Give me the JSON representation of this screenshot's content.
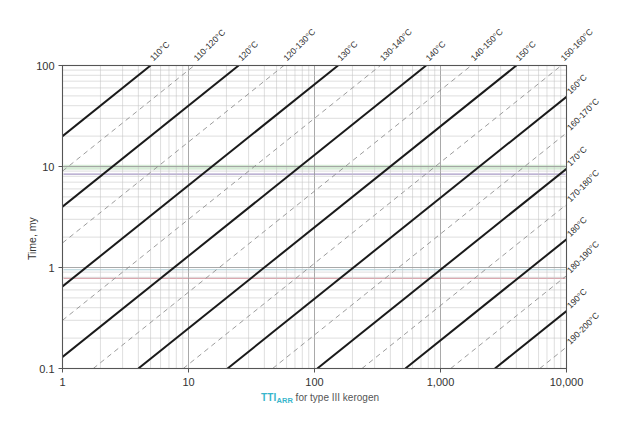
{
  "chart_data": {
    "type": "line",
    "title": "",
    "xlabel": "TTI_ARR for type III kerogen",
    "xlabel_prefix": "TTI",
    "xlabel_sub": "ARR",
    "xlabel_suffix": " for type III kerogen",
    "ylabel": "Time, my",
    "xscale": "log",
    "yscale": "log",
    "xlim": [
      1,
      10000
    ],
    "ylim": [
      0.1,
      100
    ],
    "grid": "log-minor-both",
    "legend": "none",
    "xticks": [
      "1",
      "10",
      "100",
      "1,000",
      "10,000"
    ],
    "xtick_values": [
      1,
      10,
      100,
      1000,
      10000
    ],
    "yticks": [
      "100",
      "10",
      "1",
      "0.1"
    ],
    "ytick_values": [
      100,
      10,
      1,
      0.1
    ],
    "accent_color": "#38b6cc",
    "solid_line_color": "#1a1a1a",
    "dashed_line_color": "#8a8a8a",
    "grid_color": "#b8b8b8",
    "axis_color": "#555555",
    "highlight_bands": [
      {
        "name": "green-band",
        "y_top": 10.4,
        "y_bottom": 9.3,
        "color": "#cfe8cf"
      },
      {
        "name": "violet-line",
        "y": 8.4,
        "color": "#a090c0"
      },
      {
        "name": "pink-line",
        "y": 0.78,
        "color": "#d8a0a8"
      },
      {
        "name": "teal-line",
        "y": 0.95,
        "color": "#a8ccd4"
      }
    ],
    "series": [
      {
        "name": "110 C",
        "style": "solid",
        "label": "110°C",
        "label_side": "top",
        "y_at_x1": 20.0
      },
      {
        "name": "110-120 C",
        "style": "dashed",
        "label": "110-120°C",
        "label_side": "top",
        "y_at_x1": 9.0
      },
      {
        "name": "120 C",
        "style": "solid",
        "label": "120°C",
        "label_side": "top",
        "y_at_x1": 4.0
      },
      {
        "name": "120-130 C",
        "style": "dashed",
        "label": "120-130°C",
        "label_side": "top",
        "y_at_x1": 1.75
      },
      {
        "name": "130 C",
        "style": "solid",
        "label": "130°C",
        "label_side": "top",
        "y_at_x1": 0.65
      },
      {
        "name": "130-140 C",
        "style": "dashed",
        "label": "130-140°C",
        "label_side": "top",
        "y_at_x1": 0.3
      },
      {
        "name": "140 C",
        "style": "solid",
        "label": "140°C",
        "label_side": "top",
        "y_at_x1": 0.13
      },
      {
        "name": "140-150 C",
        "style": "dashed",
        "label": "140-150°C",
        "label_side": "top",
        "y_at_x1": 0.057
      },
      {
        "name": "150 C",
        "style": "solid",
        "label": "150°C",
        "label_side": "top",
        "y_at_x1": 0.025
      },
      {
        "name": "150-160 C",
        "style": "dashed",
        "label": "150-160°C",
        "label_side": "top",
        "y_at_x1": 0.011
      },
      {
        "name": "160 C",
        "style": "solid",
        "label": "160°C",
        "label_side": "top",
        "y_at_x1": 0.0049
      },
      {
        "name": "160-170 C",
        "style": "dashed",
        "label": "160-170°C",
        "label_side": "right",
        "y_at_x1": 0.00215
      },
      {
        "name": "170 C",
        "style": "solid",
        "label": "170°C",
        "label_side": "right",
        "y_at_x1": 0.00095
      },
      {
        "name": "170-180 C",
        "style": "dashed",
        "label": "170-180°C",
        "label_side": "right",
        "y_at_x1": 0.00042
      },
      {
        "name": "180 C",
        "style": "solid",
        "label": "180°C",
        "label_side": "right",
        "y_at_x1": 0.00019
      },
      {
        "name": "180-190 C",
        "style": "dashed",
        "label": "180-190°C",
        "label_side": "right",
        "y_at_x1": 8.3e-05
      },
      {
        "name": "190 C",
        "style": "solid",
        "label": "190°C",
        "label_side": "right",
        "y_at_x1": 3.7e-05
      },
      {
        "name": "190-200 C",
        "style": "dashed",
        "label": "190-200°C",
        "label_side": "right",
        "y_at_x1": 1.63e-05
      },
      {
        "name": "200 C",
        "style": "solid",
        "label": "200°C",
        "label_side": "right",
        "y_at_x1": 7.2e-06
      },
      {
        "name": "200-210 C",
        "style": "dashed",
        "label": "200-210°C",
        "label_side": "right",
        "y_at_x1": 3.2e-06
      },
      {
        "name": "210 C",
        "style": "solid",
        "label": "210°C",
        "label_side": "right",
        "y_at_x1": 1.4e-06
      }
    ]
  }
}
